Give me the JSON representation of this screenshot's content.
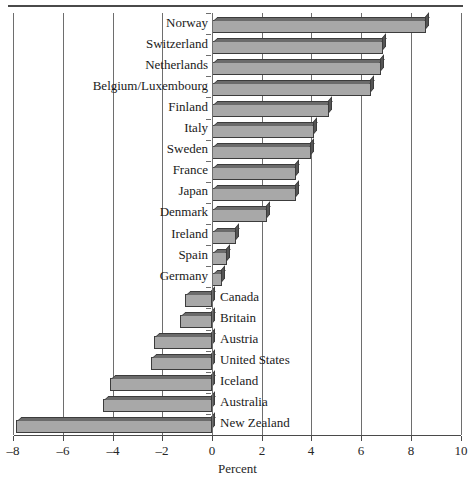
{
  "chart_data": {
    "type": "bar",
    "orientation": "horizontal",
    "title": "",
    "xlabel": "Percent",
    "ylabel": "",
    "xlim": [
      -8,
      10
    ],
    "xticks": [
      -8,
      -6,
      -4,
      -2,
      0,
      2,
      4,
      6,
      8,
      10
    ],
    "xticklabels": [
      "–8",
      "–6",
      "–4",
      "–2",
      "0",
      "2",
      "4",
      "6",
      "8",
      "10"
    ],
    "grid": true,
    "grid_axis": "x",
    "legend": null,
    "categories": [
      "Norway",
      "Switzerland",
      "Netherlands",
      "Belgium/Luxembourg",
      "Finland",
      "Italy",
      "Sweden",
      "France",
      "Japan",
      "Denmark",
      "Ireland",
      "Spain",
      "Germany",
      "Canada",
      "Britain",
      "Austria",
      "United States",
      "Iceland",
      "Australia",
      "New Zealand"
    ],
    "values": [
      8.6,
      6.9,
      6.8,
      6.4,
      4.7,
      4.1,
      4.0,
      3.4,
      3.4,
      2.2,
      0.95,
      0.6,
      0.4,
      -1.1,
      -1.3,
      -2.35,
      -2.45,
      -4.1,
      -4.4,
      -7.9
    ]
  },
  "style": {
    "bar_face_color": "#a8a8a8",
    "bar_top_color": "#6b6b6b",
    "bar_side_color": "#555555",
    "bar_edge_color": "#3c3c3c",
    "grid_color": "#6e6e6e",
    "axis_color": "#4a4a4a",
    "text_color": "#1a1a1a",
    "background": "#ffffff"
  }
}
